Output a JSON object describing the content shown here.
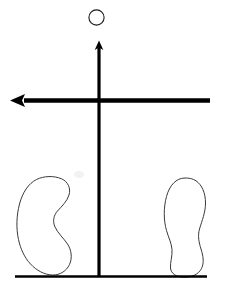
{
  "figure": {
    "background_color": "#ffffff",
    "stroke_color": "#000000",
    "width": 228,
    "height": 292,
    "elements": {
      "ball": {
        "name": "ball",
        "shape": "circle-outline",
        "cx": 96.5,
        "cy": 17.5,
        "r": 7.6,
        "stroke_width": 1.1,
        "fill": "none",
        "color": "#1a1a1a"
      },
      "vertical_arrow": {
        "name": "vertical-force-arrow",
        "direction": "up",
        "x": 99,
        "y_tail": 276,
        "y_tip": 41,
        "shaft_width": 3.2,
        "head_width": 8,
        "head_length": 9,
        "color": "#000000"
      },
      "horizontal_arrow": {
        "name": "horizontal-force-arrow",
        "direction": "left",
        "y": 100.5,
        "x_tail": 210,
        "x_tip": 10,
        "shaft_width": 4.2,
        "head_width": 13,
        "head_length": 14,
        "color": "#000000"
      },
      "ground_line": {
        "name": "ground-line",
        "x1": 15,
        "x2": 207,
        "y": 276.5,
        "stroke_width": 2.2,
        "color": "#000000"
      },
      "left_foot": {
        "name": "left-footprint",
        "side": "left",
        "orientation": "tilted-outward",
        "bbox": [
          13,
          177,
          60,
          100
        ],
        "stroke_width": 1.0,
        "fill": "none",
        "color": "#3a3a3a"
      },
      "right_foot": {
        "name": "right-footprint",
        "side": "right",
        "orientation": "upright",
        "bbox": [
          163,
          177,
          44,
          100
        ],
        "stroke_width": 1.0,
        "fill": "none",
        "color": "#3a3a3a"
      },
      "smudge": {
        "name": "paper-smudge",
        "x": 74,
        "y": 171,
        "color": "#f2f2f2"
      }
    }
  }
}
